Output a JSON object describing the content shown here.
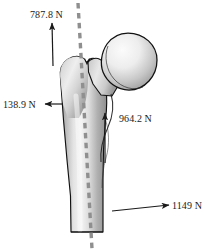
{
  "figure": {
    "background_color": "#ffffff",
    "bone_name": "femur",
    "axis_line": {
      "name": "mechanical-axis",
      "style": "dashed",
      "color": "#8f8f8f"
    },
    "colors": {
      "outline": "#111111",
      "bone_light": "#f2f2f2",
      "bone_mid": "#c9c9c9",
      "bone_dark": "#8a8a8a",
      "arrow": "#1a1a1a",
      "dashed_axis": "#8f8f8f",
      "text": "#1a1a1a"
    },
    "forces": [
      {
        "id": "abductor",
        "label": "787.8 N",
        "value": 787.8,
        "unit": "N",
        "direction": "up",
        "label_x": 30,
        "label_y": 18,
        "arrow": {
          "x1": 53,
          "y1": 66,
          "x2": 52,
          "y2": 23
        }
      },
      {
        "id": "lateral",
        "label": "138.9 N",
        "value": 138.9,
        "unit": "N",
        "direction": "left",
        "label_x": 3,
        "label_y": 108,
        "arrow": {
          "x1": 63,
          "y1": 104,
          "x2": 44,
          "y2": 104
        }
      },
      {
        "id": "joint-reaction",
        "label": "964.2 N",
        "value": 964.2,
        "unit": "N",
        "direction": "up",
        "label_x": 119,
        "label_y": 122,
        "arrow": {
          "x1": 105,
          "y1": 163,
          "x2": 105,
          "y2": 112
        }
      },
      {
        "id": "distal",
        "label": "1149 N",
        "value": 1149,
        "unit": "N",
        "direction": "right",
        "label_x": 173,
        "label_y": 209,
        "arrow": {
          "x1": 112,
          "y1": 211,
          "x2": 170,
          "y2": 205
        }
      }
    ]
  }
}
